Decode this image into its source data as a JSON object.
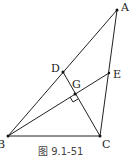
{
  "figure": {
    "caption": "图 9.1-51",
    "points": {
      "A": {
        "label": "A",
        "x": 117,
        "y": 10
      },
      "B": {
        "label": "B",
        "x": 8,
        "y": 136
      },
      "C": {
        "label": "C",
        "x": 100,
        "y": 136
      },
      "D": {
        "label": "D",
        "x": 63,
        "y": 72
      },
      "E": {
        "label": "E",
        "x": 109,
        "y": 73
      },
      "G": {
        "label": "G",
        "x": 75,
        "y": 94
      }
    },
    "segments": [
      "AB",
      "BC",
      "CA",
      "CD",
      "BE"
    ],
    "right_angle_at": "G",
    "line_color": "#222222"
  }
}
